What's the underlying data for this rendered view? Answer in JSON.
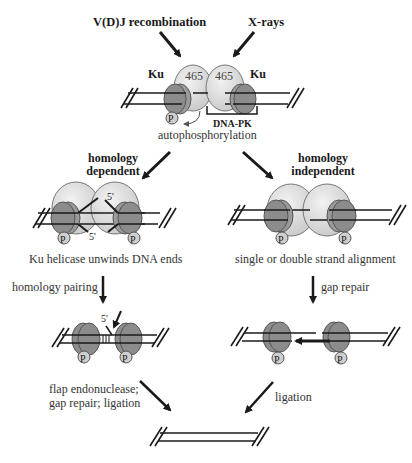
{
  "inputs": {
    "left": "V(D)J recombination",
    "right": "X-rays"
  },
  "top_complex": {
    "ku_left": "Ku",
    "ku_right": "Ku",
    "subunit_left": "465",
    "subunit_right": "465",
    "bracket_label": "DNA-PK",
    "phospho": "P",
    "caption": "autophosphorylation"
  },
  "branches": {
    "left": {
      "title_line1": "homology",
      "title_line2": "dependent",
      "complex_caption": "Ku helicase unwinds DNA ends",
      "end_label_top": "5'",
      "end_label_bottom": "5'",
      "step1_label": "homology pairing",
      "step2_end_label": "5'",
      "step2_label_line1": "flap endonuclease;",
      "step2_label_line2": "gap repair; ligation"
    },
    "right": {
      "title_line1": "homology",
      "title_line2": "independent",
      "complex_caption": "single or double strand alignment",
      "step1_label": "gap repair",
      "step2_label": "ligation"
    }
  },
  "phospho_label": "P",
  "colors": {
    "ku": "#8c8c8c",
    "subunit": "#dcdcdc",
    "line": "#1a1a1a",
    "phospho": "#cfcfcf"
  }
}
